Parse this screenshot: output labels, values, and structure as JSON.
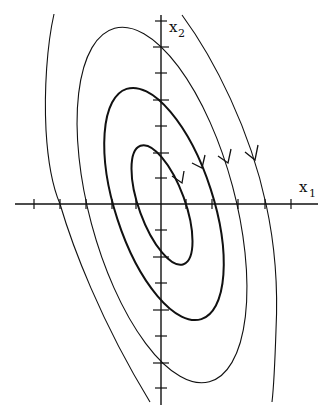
{
  "figure": {
    "type": "phase-portrait",
    "x_axis_label": {
      "main": "x",
      "sub": "1"
    },
    "y_axis_label": {
      "main": "x",
      "sub": "2"
    },
    "origin_px": [
      161,
      204
    ],
    "x_axis_extent_px": [
      15,
      318
    ],
    "y_axis_extent_px": [
      15,
      405
    ],
    "x_ticks_px": [
      34,
      60,
      86,
      112,
      136,
      186,
      212,
      238,
      265,
      291
    ],
    "y_ticks_px": [
      21,
      47,
      73,
      100,
      126,
      153,
      178,
      230,
      257,
      283,
      310,
      336,
      363,
      388
    ],
    "orbits": [
      {
        "name": "inner-ellipse",
        "closed": true,
        "y_intercepts_px": [
          153,
          257
        ],
        "x_intercepts_px": [
          137,
          187
        ],
        "weight": "thick"
      },
      {
        "name": "middle-ellipse",
        "closed": true,
        "y_intercepts_px": [
          100,
          310
        ],
        "x_intercepts_px": [
          112,
          213
        ],
        "weight": "thick"
      },
      {
        "name": "outer-ellipse",
        "closed": true,
        "y_intercepts_px": [
          47,
          363
        ],
        "x_intercepts_px": [
          86,
          239
        ],
        "weight": "thin"
      },
      {
        "name": "outermost-trajectory",
        "closed": false,
        "x_intercepts_px": [
          60,
          266
        ],
        "weight": "thin"
      }
    ],
    "flow_direction": "clockwise",
    "arrow_count": 4,
    "colors": {
      "ink": "#111111",
      "background": "#ffffff"
    }
  }
}
